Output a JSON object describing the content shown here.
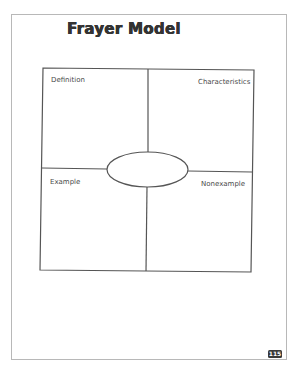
{
  "page": {
    "title": "Frayer Model",
    "page_number": "115"
  },
  "frayer_model": {
    "quadrants": [
      {
        "position": "top-left",
        "label": "Definition"
      },
      {
        "position": "top-right",
        "label": "Characteristics"
      },
      {
        "position": "bottom-left",
        "label": "Example"
      },
      {
        "position": "bottom-right",
        "label": "Nonexample"
      }
    ],
    "center_oval_text": ""
  },
  "colors": {
    "line": "#555555",
    "frame": "#b8b8b8",
    "title": "#333333",
    "label": "#4a4a4a",
    "page_badge": "#3a3a3a"
  }
}
